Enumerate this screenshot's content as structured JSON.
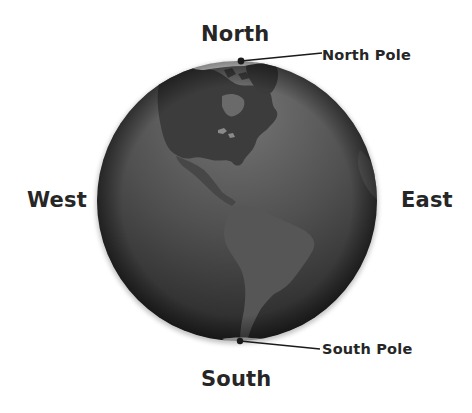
{
  "diagram": {
    "directions": {
      "north": "North",
      "south": "South",
      "west": "West",
      "east": "East"
    },
    "poles": {
      "north": "North Pole",
      "south": "South Pole"
    },
    "globe": {
      "visible_continents": [
        "North America",
        "South America",
        "Greenland"
      ],
      "style": "greyscale",
      "colors": {
        "ocean_light": "#6a6a6a",
        "ocean_dark": "#262626",
        "land_north_america": "#3a3a3a",
        "land_south_america": "#585858",
        "ice": "#f2f2f2",
        "pointer": "#1a1a1a"
      }
    }
  }
}
